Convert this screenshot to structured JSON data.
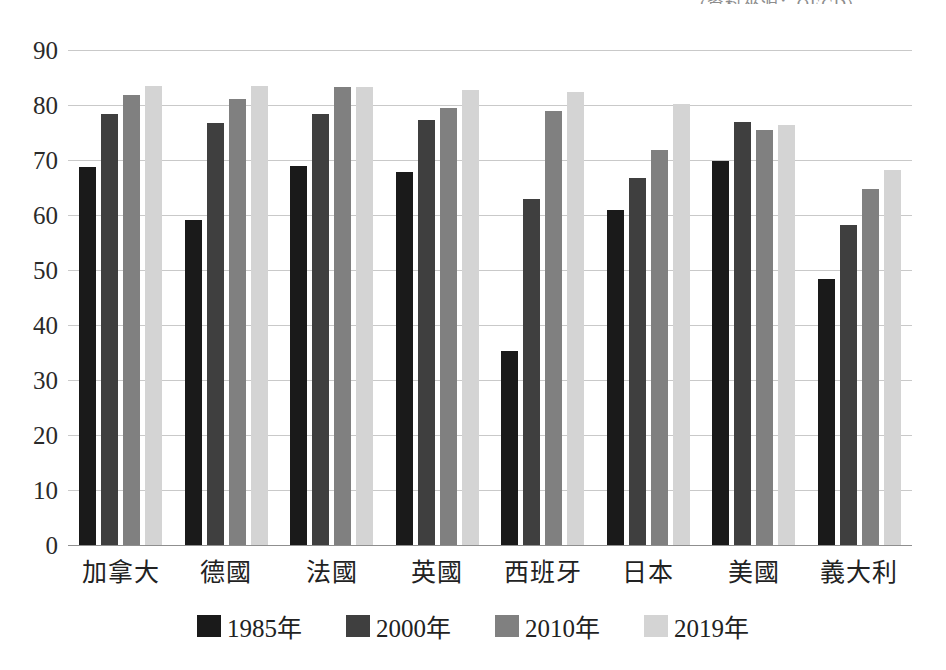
{
  "top_caption": "(資料來源：OECD)",
  "legend": {
    "position": "bottom",
    "items": [
      {
        "label": "1985年",
        "color": "#1a1a1a",
        "icon": "square-swatch-icon"
      },
      {
        "label": "2000年",
        "color": "#3f3f3f",
        "icon": "square-swatch-icon"
      },
      {
        "label": "2010年",
        "color": "#808080",
        "icon": "square-swatch-icon"
      },
      {
        "label": "2019年",
        "color": "#d4d4d4",
        "icon": "square-swatch-icon"
      }
    ]
  },
  "y_axis": {
    "ticks": [
      "90",
      "80",
      "70",
      "60",
      "50",
      "40",
      "30",
      "20",
      "10",
      "0"
    ],
    "min": 0,
    "max": 90,
    "step": 10
  },
  "chart_data": {
    "type": "bar",
    "title": "",
    "subtitle": "",
    "xlabel": "",
    "ylabel": "",
    "ylim": [
      0,
      90
    ],
    "ytick_step": 10,
    "grid": true,
    "legend_position": "bottom",
    "categories": [
      "加拿大",
      "德國",
      "法國",
      "英國",
      "西班牙",
      "日本",
      "美國",
      "義大利"
    ],
    "series": [
      {
        "name": "1985年",
        "color": "#1a1a1a",
        "values": [
          68.7,
          59.1,
          68.9,
          67.9,
          35.2,
          60.9,
          69.8,
          48.3
        ]
      },
      {
        "name": "2000年",
        "color": "#3f3f3f",
        "values": [
          78.4,
          76.8,
          78.4,
          77.2,
          62.9,
          66.8,
          76.9,
          58.2
        ]
      },
      {
        "name": "2010年",
        "color": "#808080",
        "values": [
          81.9,
          81.1,
          83.3,
          79.4,
          78.9,
          71.9,
          75.5,
          64.8
        ]
      },
      {
        "name": "2019年",
        "color": "#d4d4d4",
        "values": [
          83.5,
          83.4,
          83.2,
          82.8,
          82.4,
          80.2,
          76.3,
          68.1
        ]
      }
    ]
  }
}
